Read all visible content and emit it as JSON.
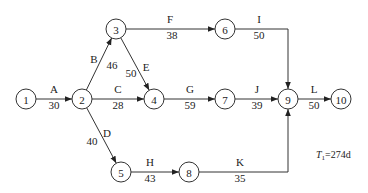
{
  "diagram": {
    "type": "activity-on-arrow network",
    "nodes": [
      {
        "id": "1",
        "label": "1",
        "x": 26,
        "y": 99
      },
      {
        "id": "2",
        "label": "2",
        "x": 82,
        "y": 99
      },
      {
        "id": "3",
        "label": "3",
        "x": 116,
        "y": 29
      },
      {
        "id": "4",
        "label": "4",
        "x": 154,
        "y": 99
      },
      {
        "id": "5",
        "label": "5",
        "x": 121,
        "y": 172
      },
      {
        "id": "6",
        "label": "6",
        "x": 225,
        "y": 29
      },
      {
        "id": "7",
        "label": "7",
        "x": 225,
        "y": 99
      },
      {
        "id": "8",
        "label": "8",
        "x": 189,
        "y": 172
      },
      {
        "id": "9",
        "label": "9",
        "x": 288,
        "y": 99
      },
      {
        "id": "10",
        "label": "10",
        "x": 341,
        "y": 99
      }
    ],
    "edges": [
      {
        "activity": "A",
        "duration": "30",
        "from": "1",
        "to": "2"
      },
      {
        "activity": "B",
        "duration": "46",
        "from": "2",
        "to": "3"
      },
      {
        "activity": "C",
        "duration": "28",
        "from": "2",
        "to": "4"
      },
      {
        "activity": "D",
        "duration": "40",
        "from": "2",
        "to": "5"
      },
      {
        "activity": "E",
        "duration": "50",
        "from": "3",
        "to": "4"
      },
      {
        "activity": "F",
        "duration": "38",
        "from": "3",
        "to": "6"
      },
      {
        "activity": "G",
        "duration": "59",
        "from": "4",
        "to": "7"
      },
      {
        "activity": "H",
        "duration": "43",
        "from": "5",
        "to": "8"
      },
      {
        "activity": "I",
        "duration": "50",
        "from": "6",
        "to": "9"
      },
      {
        "activity": "J",
        "duration": "39",
        "from": "7",
        "to": "9"
      },
      {
        "activity": "K",
        "duration": "35",
        "from": "8",
        "to": "9"
      },
      {
        "activity": "L",
        "duration": "50",
        "from": "9",
        "to": "10"
      }
    ],
    "note": {
      "symbol": "T",
      "subscript": "1",
      "value": "=274d"
    }
  }
}
